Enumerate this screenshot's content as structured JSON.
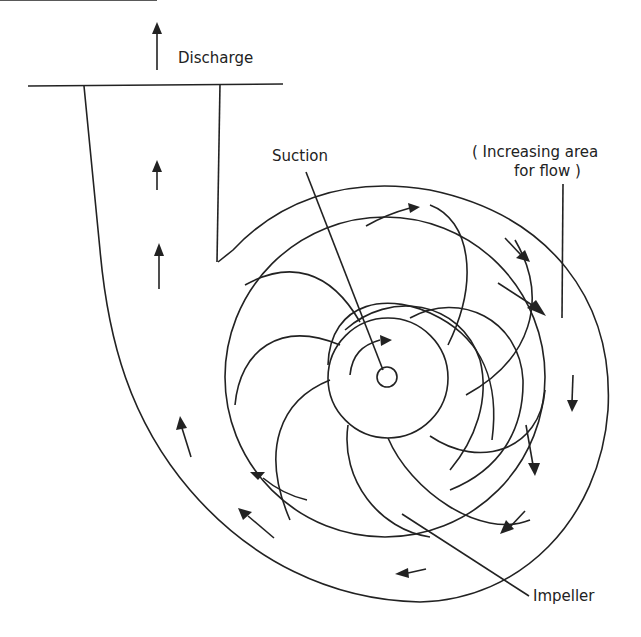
{
  "diagram": {
    "labels": {
      "discharge": "Discharge",
      "suction": "Suction",
      "area_line1": "( Increasing area",
      "area_line2": "for flow )",
      "impeller": "Impeller"
    },
    "colors": {
      "stroke": "#222222",
      "background": "#ffffff"
    }
  }
}
